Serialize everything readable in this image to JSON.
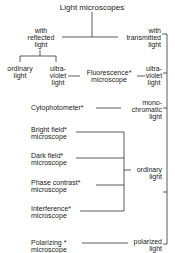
{
  "title": "Light microscopes",
  "branches": {
    "reflected": [
      "with",
      "reflected",
      "light"
    ],
    "transmitted": [
      "with",
      "transmitted",
      "light"
    ]
  },
  "reflected_children": {
    "ordinary": [
      "ordinary",
      "light"
    ],
    "ultraviolet": [
      "ultra-",
      "violet",
      "light"
    ]
  },
  "transmitted_children": {
    "ultraviolet": [
      "ultra-",
      "violet",
      "light"
    ],
    "monochromatic": [
      "mono-",
      "chromatic",
      "light"
    ],
    "ordinary": [
      "ordinary",
      "light"
    ],
    "polarized": [
      "polarized",
      "light"
    ]
  },
  "microscopes": {
    "fluorescence": [
      "Fluorescence*",
      "microscope"
    ],
    "cytophotometer": "Cytophotometer*",
    "bright_field": [
      "Bright  field*",
      "microscope"
    ],
    "dark_field": [
      "Dark  field*",
      "microscope"
    ],
    "phase_contrast": [
      "Phase  contrast*",
      "microscope"
    ],
    "interference": [
      "Interference*",
      "microscope"
    ],
    "polarizing": [
      "Polarizing  *",
      "microscope"
    ]
  }
}
